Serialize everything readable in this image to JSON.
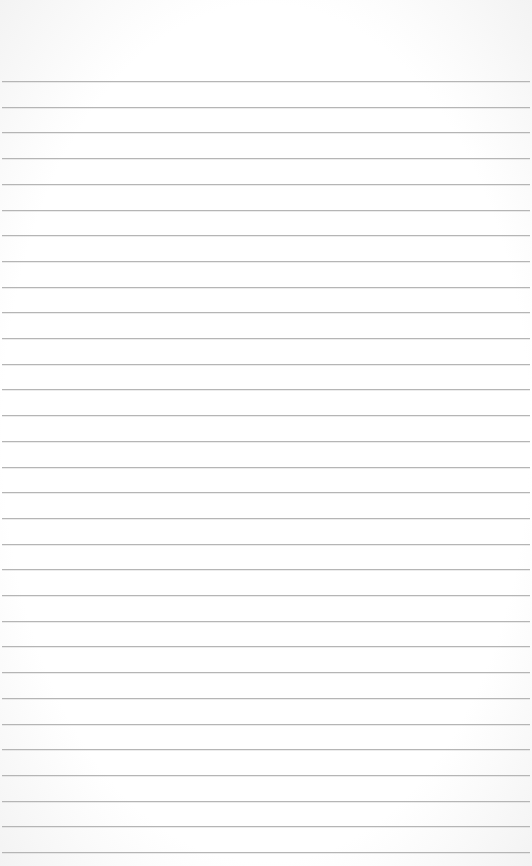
{
  "paper": {
    "type": "ruled-lined-paper",
    "background_color": "#fdfdfd",
    "rule_color": "#b5b5b5",
    "first_rule_y": 81,
    "rule_spacing": 25.7,
    "rule_count": 31
  }
}
